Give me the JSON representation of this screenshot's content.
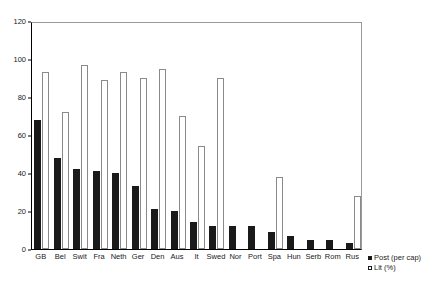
{
  "chart_data": {
    "type": "bar",
    "title": "",
    "subtitle": "",
    "xlabel": "",
    "ylabel": "",
    "ylim": [
      0,
      120
    ],
    "yticks": [
      0,
      20,
      40,
      60,
      80,
      100,
      120
    ],
    "ytick_labels": [
      "0",
      "20",
      "40",
      "60",
      "80",
      "100",
      "120"
    ],
    "grid": false,
    "legend_position": "bottom-right",
    "categories": [
      "GB",
      "Bel",
      "Swit",
      "Fra",
      "Neth",
      "Ger",
      "Den",
      "Aus",
      "It",
      "Swed",
      "Nor",
      "Port",
      "Spa",
      "Hun",
      "Serb",
      "Rom",
      "Rus"
    ],
    "series": [
      {
        "name": "Post (per cap)",
        "color": "#1a1a1a",
        "values": [
          68,
          48,
          42,
          41,
          40,
          33,
          21,
          20,
          14,
          12,
          12,
          12,
          9,
          7,
          5,
          5,
          3
        ]
      },
      {
        "name": "Lit (%)",
        "color": "#ffffff",
        "values": [
          93,
          72,
          97,
          89,
          93,
          90,
          95,
          70,
          54,
          90,
          null,
          null,
          38,
          null,
          null,
          null,
          28
        ]
      }
    ]
  },
  "legend": {
    "entries": [
      {
        "label": "Post (per cap)",
        "marker": "filled-square"
      },
      {
        "label": "Lit (%)",
        "marker": "open-square"
      }
    ]
  }
}
